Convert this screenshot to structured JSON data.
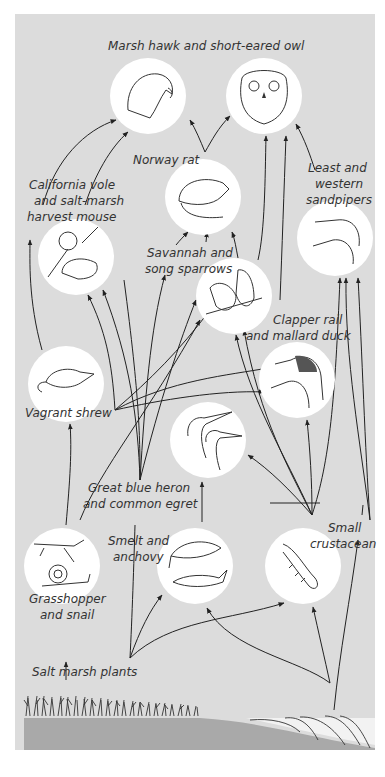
{
  "diagram": {
    "colors": {
      "background": "#dcdcdc",
      "circle": "#ffffff",
      "ground": "#a9a9a9",
      "ink": "#222222"
    },
    "nodes": [
      {
        "id": "hawk",
        "label": "Marsh hawk and short-eared owl",
        "cx": 148,
        "cy": 96,
        "r": 38,
        "icon": "hawk-icon"
      },
      {
        "id": "owl",
        "cx": 264,
        "cy": 96,
        "r": 38,
        "icon": "owl-icon"
      },
      {
        "id": "rat",
        "label": "Norway rat",
        "cx": 203,
        "cy": 197,
        "r": 38,
        "icon": "rat-icon"
      },
      {
        "id": "vole",
        "label": "California vole\nand salt-marsh\nharvest mouse",
        "cx": 76,
        "cy": 257,
        "r": 38,
        "icon": "mouse-icon"
      },
      {
        "id": "sandpiper",
        "label": "Least and\nwestern\nsandpipers",
        "cx": 335,
        "cy": 238,
        "r": 38,
        "icon": "sandpiper-icon"
      },
      {
        "id": "sparrow",
        "label": "Savannah and\nsong sparrows",
        "cx": 234,
        "cy": 296,
        "r": 38,
        "icon": "sparrow-icon"
      },
      {
        "id": "duck",
        "label": "Clapper rail\nand mallard duck",
        "cx": 297,
        "cy": 380,
        "r": 38,
        "icon": "duck-icon"
      },
      {
        "id": "shrew",
        "label": "Vagrant shrew",
        "cx": 66,
        "cy": 384,
        "r": 38,
        "icon": "shrew-icon"
      },
      {
        "id": "heron",
        "label": "Great blue heron\nand common egret",
        "cx": 208,
        "cy": 440,
        "r": 38,
        "icon": "heron-icon"
      },
      {
        "id": "grasshopper",
        "label": "Grasshopper\nand snail",
        "cx": 62,
        "cy": 566,
        "r": 38,
        "icon": "grasshopper-snail-icon"
      },
      {
        "id": "fish",
        "label": "Smelt and\nanchovy",
        "cx": 195,
        "cy": 566,
        "r": 38,
        "icon": "fish-icon"
      },
      {
        "id": "crustacean",
        "label": "Small\ncrustacean",
        "cx": 303,
        "cy": 566,
        "r": 38,
        "icon": "crustacean-icon"
      }
    ],
    "labels": {
      "top": "Marsh hawk and short-eared owl",
      "rat": "Norway rat",
      "vole_1": "California vole",
      "vole_2": "and salt-marsh",
      "vole_3": "harvest mouse",
      "sandpiper_1": "Least and",
      "sandpiper_2": "western",
      "sandpiper_3": "sandpipers",
      "sparrow_1": "Savannah and",
      "sparrow_2": "song sparrows",
      "duck_1": "Clapper rail",
      "duck_2": "and mallard duck",
      "shrew": "Vagrant shrew",
      "heron_1": "Great blue heron",
      "heron_2": "and common egret",
      "fish_1": "Smelt and",
      "fish_2": "anchovy",
      "crust_1": "Small",
      "crust_2": "crustacean",
      "grass_1": "Grasshopper",
      "grass_2": "and snail",
      "plants": "Salt marsh plants"
    },
    "edges": [
      [
        "vole",
        "hawk"
      ],
      [
        "vole",
        "hawk"
      ],
      [
        "rat",
        "hawk"
      ],
      [
        "rat",
        "owl"
      ],
      [
        "sparrow",
        "owl"
      ],
      [
        "duck",
        "owl"
      ],
      [
        "sandpiper",
        "owl"
      ],
      [
        "sparrow",
        "rat"
      ],
      [
        "shrew",
        "hawk"
      ],
      [
        "plants",
        "vole"
      ],
      [
        "plants",
        "rat"
      ],
      [
        "plants",
        "sparrow"
      ],
      [
        "plants",
        "duck"
      ],
      [
        "plants",
        "grasshopper"
      ],
      [
        "grasshopper",
        "shrew"
      ],
      [
        "grasshopper",
        "sparrow"
      ],
      [
        "fish",
        "heron"
      ],
      [
        "crustacean",
        "heron"
      ],
      [
        "crustacean",
        "duck"
      ],
      [
        "crustacean",
        "sandpiper"
      ],
      [
        "crustacean",
        "rat"
      ],
      [
        "plants",
        "fish"
      ],
      [
        "plants",
        "crustacean"
      ]
    ]
  }
}
